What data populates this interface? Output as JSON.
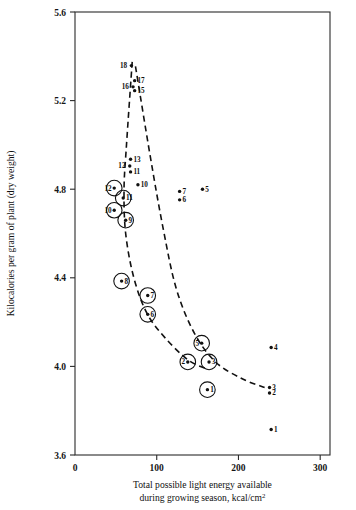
{
  "chart_data": {
    "type": "scatter",
    "title": "",
    "xlabel": "Total possible light energy available during growing season, kcal/cm²",
    "xlabel_line1": "Total possible light energy available",
    "xlabel_line2": "during growing season, kcal/cm",
    "xlabel_super": "2",
    "ylabel": "Kilocalories per gram of plant  (dry weight)",
    "xlim": [
      0,
      312
    ],
    "ylim": [
      3.6,
      5.6
    ],
    "xticks": [
      0,
      100,
      200,
      300
    ],
    "xticklabels": [
      "0",
      "100",
      "200",
      "300"
    ],
    "yticks": [
      3.6,
      4.0,
      4.4,
      4.8,
      5.2,
      5.6
    ],
    "yticklabels": [
      "3.6",
      "4.0",
      "4.4",
      "4.8",
      "5.2",
      "5.6"
    ],
    "grid": false,
    "legend": "none",
    "series": [
      {
        "name": "circled",
        "marker": "dot-in-circle",
        "points": [
          {
            "label": "12",
            "x": 48,
            "y": 4.805,
            "label_pos": "inside-left"
          },
          {
            "label": "11",
            "x": 59,
            "y": 4.76,
            "label_pos": "inside-right"
          },
          {
            "label": "10",
            "x": 48,
            "y": 4.705,
            "label_pos": "inside-left"
          },
          {
            "label": "9",
            "x": 62,
            "y": 4.66,
            "label_pos": "inside-right"
          },
          {
            "label": "8",
            "x": 57,
            "y": 4.385,
            "label_pos": "inside-right"
          },
          {
            "label": "7",
            "x": 89,
            "y": 4.32,
            "label_pos": "inside-right"
          },
          {
            "label": "6",
            "x": 89,
            "y": 4.235,
            "label_pos": "inside-right"
          },
          {
            "label": "5",
            "x": 155,
            "y": 4.105,
            "label_pos": "inside-left"
          },
          {
            "label": "2",
            "x": 138,
            "y": 4.02,
            "label_pos": "inside-left"
          },
          {
            "label": "3",
            "x": 164,
            "y": 4.02,
            "label_pos": "inside-right"
          },
          {
            "label": "1",
            "x": 162,
            "y": 3.895,
            "label_pos": "inside-right"
          }
        ]
      },
      {
        "name": "plain",
        "marker": "dot",
        "points": [
          {
            "label": "18",
            "x": 69,
            "y": 5.358,
            "label_pos": "left"
          },
          {
            "label": "17",
            "x": 73,
            "y": 5.29,
            "label_pos": "right"
          },
          {
            "label": "16",
            "x": 71,
            "y": 5.262,
            "label_pos": "left"
          },
          {
            "label": "15",
            "x": 73,
            "y": 5.245,
            "label_pos": "right"
          },
          {
            "label": "13",
            "x": 68,
            "y": 4.935,
            "label_pos": "right"
          },
          {
            "label": "12",
            "x": 67,
            "y": 4.905,
            "label_pos": "left"
          },
          {
            "label": "11",
            "x": 68,
            "y": 4.878,
            "label_pos": "right"
          },
          {
            "label": "10",
            "x": 77,
            "y": 4.82,
            "label_pos": "right"
          },
          {
            "label": "7",
            "x": 128,
            "y": 4.79,
            "label_pos": "right"
          },
          {
            "label": "6",
            "x": 128,
            "y": 4.752,
            "label_pos": "right"
          },
          {
            "label": "5",
            "x": 156,
            "y": 4.8,
            "label_pos": "right"
          },
          {
            "label": "4",
            "x": 240,
            "y": 4.085,
            "label_pos": "right"
          },
          {
            "label": "3",
            "x": 238,
            "y": 3.905,
            "label_pos": "right"
          },
          {
            "label": "2",
            "x": 238,
            "y": 3.88,
            "label_pos": "right"
          },
          {
            "label": "1",
            "x": 240,
            "y": 3.715,
            "label_pos": "right"
          }
        ]
      }
    ],
    "curves": [
      {
        "name": "left-dashed-trend",
        "style": "dashed",
        "points": [
          {
            "x": 70,
            "y": 5.375
          },
          {
            "x": 63,
            "y": 5.0
          },
          {
            "x": 60,
            "y": 4.8
          },
          {
            "x": 62,
            "y": 4.6
          },
          {
            "x": 72,
            "y": 4.4
          },
          {
            "x": 88,
            "y": 4.24
          },
          {
            "x": 110,
            "y": 4.13
          },
          {
            "x": 138,
            "y": 4.03
          },
          {
            "x": 160,
            "y": 3.99
          }
        ]
      },
      {
        "name": "right-dashed-trend",
        "style": "dashed",
        "points": [
          {
            "x": 74,
            "y": 5.355
          },
          {
            "x": 92,
            "y": 4.95
          },
          {
            "x": 108,
            "y": 4.62
          },
          {
            "x": 124,
            "y": 4.35
          },
          {
            "x": 146,
            "y": 4.15
          },
          {
            "x": 172,
            "y": 4.02
          },
          {
            "x": 204,
            "y": 3.945
          },
          {
            "x": 232,
            "y": 3.905
          }
        ]
      }
    ]
  }
}
